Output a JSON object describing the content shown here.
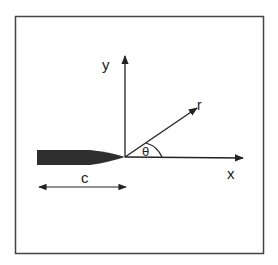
{
  "figure": {
    "labels": {
      "y_axis": "y",
      "x_axis": "x",
      "radial": "r",
      "angle": "θ",
      "crack_length": "c"
    },
    "colors": {
      "frame": "#444444",
      "lines": "#222222",
      "crack_fill": "#2e2e2e",
      "background": "#ffffff"
    }
  }
}
